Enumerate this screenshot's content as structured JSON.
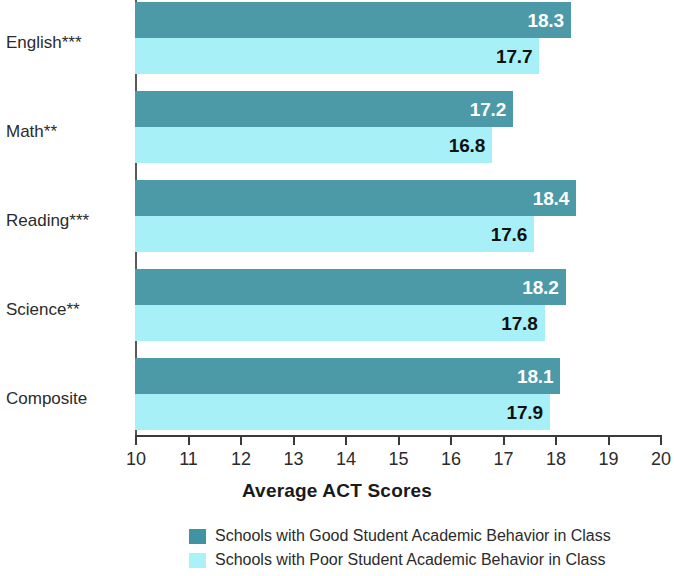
{
  "chart_data": {
    "type": "bar",
    "orientation": "horizontal",
    "title": "",
    "xlabel": "Average ACT Scores",
    "ylabel": "",
    "xlim": [
      10,
      20
    ],
    "xticks": [
      10,
      11,
      12,
      13,
      14,
      15,
      16,
      17,
      18,
      19,
      20
    ],
    "xtick_labels": [
      "10",
      "11",
      "12",
      "13",
      "14",
      "15",
      "16",
      "17",
      "18",
      "19",
      "20"
    ],
    "grid": false,
    "legend_position": "bottom",
    "categories": [
      "English***",
      "Math**",
      "Reading***",
      "Science**",
      "Composite"
    ],
    "series": [
      {
        "name": "Schools with Good Student Academic Behavior in Class",
        "color": "#4c9aa8",
        "values": [
          18.3,
          17.2,
          18.4,
          18.2,
          18.1
        ],
        "value_labels": [
          "18.3",
          "17.2",
          "18.4",
          "18.2",
          "18.1"
        ]
      },
      {
        "name": "Schools with Poor Student Academic Behavior in Class",
        "color": "#a8f0f8",
        "values": [
          17.7,
          16.8,
          17.6,
          17.8,
          17.9
        ],
        "value_labels": [
          "17.7",
          "16.8",
          "17.6",
          "17.8",
          "17.9"
        ]
      }
    ]
  },
  "legend": {
    "items": [
      {
        "label": "Schools with Good Student Academic Behavior in Class",
        "color": "#3f93a3"
      },
      {
        "label": "Schools with Poor Student Academic Behavior in Class",
        "color": "#aaf2f8"
      }
    ]
  },
  "colors": {
    "good_series": "#4c9aa8",
    "poor_series": "#a8f0f8",
    "axis": "#3a3a3a",
    "text": "#2b2b2b",
    "background": "#ffffff"
  }
}
